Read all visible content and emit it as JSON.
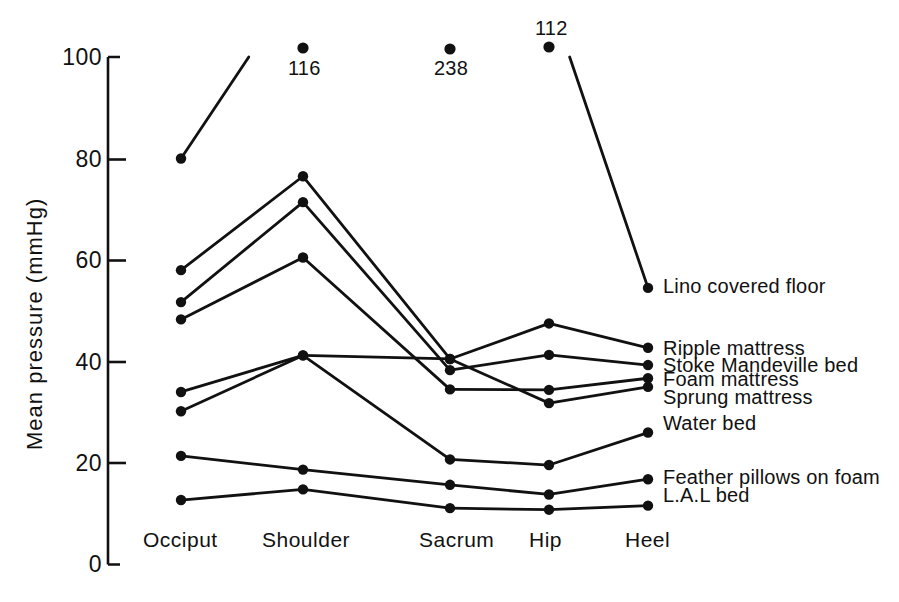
{
  "chart_data": {
    "type": "line",
    "title": "",
    "subtitle": "",
    "xlabel": "",
    "ylabel": "Mean pressure (mmHg)",
    "categories": [
      "Occiput",
      "Shoulder",
      "Sacrum",
      "Hip",
      "Heel"
    ],
    "ylim": [
      0,
      100
    ],
    "yticks": [
      0,
      20,
      40,
      60,
      80,
      100
    ],
    "ytick_labels": [
      "0",
      "20",
      "40",
      "60",
      "80",
      "100"
    ],
    "grid": false,
    "legend_position": "right-of-points",
    "series": [
      {
        "name": "Lino covered floor",
        "values": [
          80,
          116,
          238,
          112,
          54.5
        ],
        "offscale_points": [
          {
            "category": "Shoulder",
            "value": 116,
            "label": "116",
            "label_position": "below"
          },
          {
            "category": "Sacrum",
            "value": 238,
            "label": "238",
            "label_position": "below"
          },
          {
            "category": "Hip",
            "value": 112,
            "label": "112",
            "label_position": "above"
          }
        ]
      },
      {
        "name": "Ripple mattress",
        "values": [
          58,
          76.5,
          40.5,
          47.5,
          42.7
        ]
      },
      {
        "name": "Stoke Mandeville bed",
        "values": [
          51.7,
          71.4,
          38.3,
          41.3,
          39.3
        ]
      },
      {
        "name": "Foam mattress",
        "values": [
          48.3,
          60.5,
          34.5,
          34.4,
          36.7
        ]
      },
      {
        "name": "Sprung mattress",
        "values": [
          34,
          41.2,
          40.5,
          31.8,
          35.0
        ]
      },
      {
        "name": "Water bed",
        "values": [
          30.2,
          41.2,
          20.7,
          19.6,
          26.0
        ]
      },
      {
        "name": "Feather pillows on foam",
        "values": [
          21.4,
          18.7,
          15.7,
          13.8,
          16.8
        ]
      },
      {
        "name": "L.A.L bed",
        "values": [
          12.7,
          14.8,
          11.1,
          10.8,
          11.6
        ]
      }
    ],
    "annotations": [
      "116",
      "238",
      "112"
    ]
  },
  "axis": {
    "y_title": "Mean pressure (mmHg)",
    "y_tick_labels": [
      "100",
      "80",
      "60",
      "40",
      "20",
      "0"
    ],
    "x_tick_labels": [
      "Occiput",
      "Shoulder",
      "Sacrum",
      "Hip",
      "Heel"
    ]
  },
  "series_labels": {
    "lino": "Lino covered floor",
    "ripple": "Ripple mattress",
    "stoke": "Stoke Mandeville bed",
    "foam": "Foam mattress",
    "sprung": "Sprung mattress",
    "water": "Water bed",
    "feather": "Feather pillows on foam",
    "lal": "L.A.L bed"
  },
  "offscale_labels": {
    "shoulder": "116",
    "sacrum": "238",
    "hip": "112"
  },
  "colors": {
    "ink": "#111111",
    "background": "#ffffff"
  }
}
